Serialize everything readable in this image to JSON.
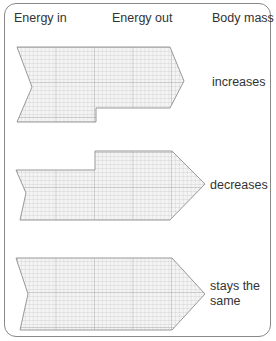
{
  "headers": {
    "energy_in": "Energy in",
    "energy_out": "Energy out",
    "body_mass": "Body mass"
  },
  "rows": [
    {
      "id": "row-1",
      "outcome": "increases",
      "description": "Energy in greater than energy out"
    },
    {
      "id": "row-2",
      "outcome": "decreases",
      "description": "Energy out greater than energy in"
    },
    {
      "id": "row-3",
      "outcome_line1": "stays the",
      "outcome_line2": "same",
      "description": "Energy in equals energy out"
    }
  ],
  "colors": {
    "border": "#888888",
    "grid_fill": "#f4f4f4",
    "grid_line": "#b8b8b8",
    "shape_outline": "#999999",
    "text": "#333333"
  }
}
